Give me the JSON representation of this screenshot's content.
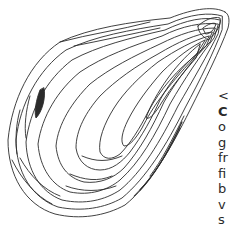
{
  "illustration": {
    "subject": "mussel shell line drawing",
    "stroke_color": "#2b2b2b",
    "background": "#ffffff"
  },
  "caption": {
    "lines": [
      "<",
      "C",
      "o",
      "g",
      "fr",
      "fi",
      "b",
      "v",
      "s"
    ]
  }
}
